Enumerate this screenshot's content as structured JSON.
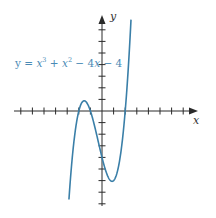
{
  "chart_data": {
    "type": "line",
    "title": "",
    "equation": "y = x^3 + x^2 - 4x - 4",
    "xlabel": "x",
    "ylabel": "y",
    "xlim": [
      -7,
      7
    ],
    "ylim": [
      -8,
      8
    ],
    "x_tick_step": 1,
    "y_tick_step": 1,
    "tick_labels_shown": false,
    "grid": false,
    "series": [
      {
        "name": "y = x^3 + x^2 - 4x - 4",
        "coefficients": [
          1,
          1,
          -4,
          -4
        ],
        "x_range": [
          -2.85,
          2.5
        ],
        "roots": [
          -2,
          -1,
          2
        ],
        "local_max": {
          "x": -1.55,
          "y": 0.88
        },
        "local_min": {
          "x": 0.87,
          "y": -6.06
        },
        "y_intercept": -4,
        "color": "#3a7fa8"
      }
    ]
  },
  "labels": {
    "x_axis": "x",
    "y_axis": "y",
    "equation_parts": {
      "lhs": "y = ",
      "x1": "x",
      "exp3": "3",
      "plus1": " + ",
      "x2": "x",
      "exp2": "2",
      "rest1": " − 4",
      "x3": "x",
      "rest2": " − 4"
    }
  },
  "colors": {
    "curve": "#3a7fa8",
    "axes": "#2a2a2a",
    "label": "#4a8ab5"
  }
}
